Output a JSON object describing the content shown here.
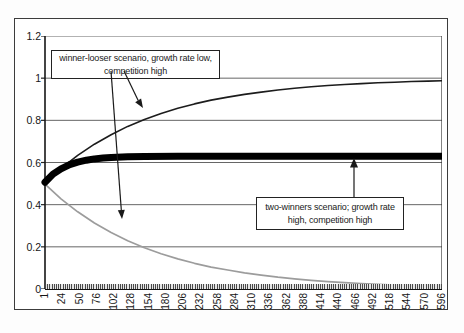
{
  "chart_data": {
    "type": "line",
    "title": "",
    "xlabel": "",
    "ylabel": "",
    "grid": "horizontal",
    "legend_position": "none",
    "x_axis": {
      "range": [
        1,
        596
      ],
      "tick_labels": [
        "1",
        "24",
        "50",
        "76",
        "102",
        "128",
        "154",
        "180",
        "206",
        "232",
        "258",
        "284",
        "310",
        "336",
        "362",
        "388",
        "414",
        "440",
        "466",
        "492",
        "518",
        "544",
        "570",
        "596"
      ]
    },
    "y_axis": {
      "range": [
        0,
        1.2
      ],
      "tick_labels": [
        "1.2",
        "1",
        "0.8",
        "0.6",
        "0.4",
        "0.2",
        "0"
      ],
      "tick_values": [
        1.2,
        1,
        0.8,
        0.6,
        0.4,
        0.2,
        0
      ]
    },
    "series": [
      {
        "name": "looser population (winner-looser scenario, growth rate low, competition high)",
        "color": "#9c9c9c",
        "stroke_width": 1.7,
        "x": [
          1,
          25,
          50,
          75,
          100,
          125,
          150,
          175,
          200,
          225,
          250,
          275,
          300,
          325,
          350,
          375,
          400,
          425,
          450,
          475,
          500,
          525,
          550,
          575,
          596
        ],
        "values": [
          0.497,
          0.428,
          0.366,
          0.313,
          0.268,
          0.229,
          0.196,
          0.167,
          0.143,
          0.122,
          0.104,
          0.09,
          0.077,
          0.066,
          0.056,
          0.048,
          0.041,
          0.035,
          0.03,
          0.026,
          0.022,
          0.019,
          0.016,
          0.014,
          0.012
        ]
      },
      {
        "name": "winner population (winner-looser scenario, growth rate low, competition high)",
        "color": "#1c1c1c",
        "stroke_width": 1.6,
        "x": [
          1,
          25,
          50,
          75,
          100,
          125,
          150,
          175,
          200,
          225,
          250,
          275,
          300,
          325,
          350,
          375,
          400,
          425,
          450,
          475,
          500,
          525,
          550,
          575,
          596
        ],
        "values": [
          0.503,
          0.572,
          0.634,
          0.687,
          0.732,
          0.771,
          0.804,
          0.833,
          0.857,
          0.878,
          0.896,
          0.91,
          0.923,
          0.934,
          0.944,
          0.952,
          0.959,
          0.965,
          0.97,
          0.974,
          0.978,
          0.981,
          0.984,
          0.986,
          0.988
        ]
      },
      {
        "name": "two-winners scenario; growth rate high, competition high",
        "color": "#000000",
        "stroke_width": 7,
        "x": [
          1,
          13,
          25,
          38,
          50,
          63,
          75,
          88,
          100,
          125,
          150,
          200,
          300,
          400,
          500,
          596
        ],
        "values": [
          0.506,
          0.545,
          0.57,
          0.59,
          0.602,
          0.611,
          0.617,
          0.621,
          0.624,
          0.627,
          0.629,
          0.63,
          0.63,
          0.63,
          0.63,
          0.63
        ]
      }
    ],
    "annotations": [
      {
        "text": "winner-looser scenario, growth rate low, competition high",
        "lines": [
          "winner-looser scenario, growth rate low,",
          "competition high"
        ]
      },
      {
        "text": "two-winners scenario; growth rate high, competition high",
        "lines": [
          "two-winners scenario; growth rate",
          "high, competition high"
        ]
      }
    ]
  }
}
